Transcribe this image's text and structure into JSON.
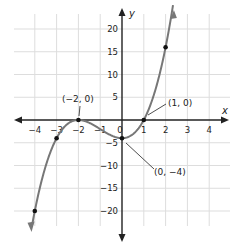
{
  "chart_data": {
    "type": "line",
    "function": "f(x) = (x+2)^2 (x-1)",
    "xlabel": "x",
    "ylabel": "y",
    "xlim": [
      -4.5,
      4.5
    ],
    "ylim": [
      -23,
      23
    ],
    "grid": true,
    "x_ticks": [
      "-4",
      "-3",
      "-2",
      "-1",
      "0",
      "1",
      "2",
      "3",
      "4"
    ],
    "y_ticks": [
      "20",
      "15",
      "10",
      "5",
      "-5",
      "-10",
      "-15",
      "-20"
    ],
    "points": [
      {
        "x": -4,
        "y": -20
      },
      {
        "x": -3,
        "y": -4
      },
      {
        "x": -2,
        "y": 0
      },
      {
        "x": 0,
        "y": -4
      },
      {
        "x": 1,
        "y": 0
      },
      {
        "x": 2,
        "y": 16
      }
    ],
    "annotations": [
      {
        "label": "(−2, 0)",
        "x": -2,
        "y": 0
      },
      {
        "label": "(1, 0)",
        "x": 1,
        "y": 0
      },
      {
        "label": "(0, −4)",
        "x": 0,
        "y": -4
      }
    ]
  }
}
